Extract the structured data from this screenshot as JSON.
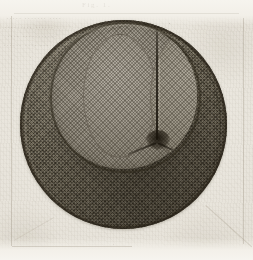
{
  "image": {
    "kind": "antique-engraved-plate-scan",
    "subject_label": "stippled spherical specimen with two cross-hatched lobes",
    "width_px": 253,
    "height_px": 260
  },
  "paper": {
    "background_color": "#e8e5dd",
    "tone_light": "#f4f1ea",
    "tone_dark": "#ddd9ce",
    "ghost_text_color": "#6d6453"
  },
  "ghost_text": {
    "note": "faint bleed-through lines from the reverse of the page, illegible",
    "caption_top": "Fig. 1.",
    "lines": [
      "····· ······· ····",
      "········· ······",
      "···· ···········",
      "······ ···· ···"
    ]
  },
  "specimen": {
    "outer_sphere": {
      "name": "outer-sphere",
      "center_x": 123,
      "center_y": 124,
      "radius": 103,
      "fill_color": "#6e6757",
      "outline_color": "#2a2416",
      "texture": "fine diagonal cross-hatch stipple"
    },
    "inner_circle": {
      "name": "inner-lobe-circle",
      "center_x": 124,
      "center_y": 95,
      "radius": 73,
      "fill_color": "#9a9488",
      "outline_color": "#2c2619",
      "texture": "fine diagonal cross-hatch, lighter tone"
    },
    "lobes": [
      {
        "name": "left-lobe",
        "fill_color": "#a29c90",
        "position": "left"
      },
      {
        "name": "right-lobe",
        "fill_color": "#9d9789",
        "position": "right"
      }
    ],
    "furrow": {
      "name": "median-furrow",
      "orientation": "vertical",
      "x": 127,
      "y_start": 22,
      "y_end": 137,
      "color": "#1e1910"
    },
    "junction": {
      "name": "furrow-junction-node",
      "x": 127,
      "y": 138,
      "color": "#181309"
    }
  },
  "plate_border": {
    "color": "#8c8270",
    "left_x": 11,
    "right_x": 243,
    "top_y": 13,
    "bottom_y": 247
  }
}
